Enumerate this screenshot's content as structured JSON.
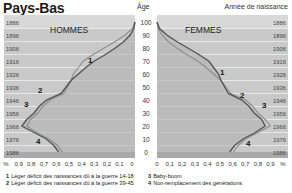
{
  "title": "Pays-Bas",
  "age_axis_label": "Âge",
  "birth_year_label": "Année de naissance",
  "colors": {
    "panel_bg": "#c9c9c9",
    "panel_band_light": "#d8d8d8",
    "grid": "#f0f0f0",
    "curve_dark": "#555555",
    "curve_light": "#8f8f8f",
    "fill": "#b3b3b3"
  },
  "chart_data": {
    "type": "population-pyramid",
    "title": "Pays-Bas",
    "panels": [
      {
        "name": "HOMMES",
        "side": "left"
      },
      {
        "name": "FEMMES",
        "side": "right"
      }
    ],
    "x_axis": {
      "label": "%",
      "left_ticks": [
        "%",
        "0,9",
        "0,8",
        "0,7",
        "0,6",
        "0,5",
        "0,4",
        "0,3",
        "0,2",
        "0,1",
        "0"
      ],
      "right_ticks": [
        "0",
        "0,1",
        "0,2",
        "0,3",
        "0,4",
        "0,5",
        "0,6",
        "0,7",
        "0,8",
        "0,9",
        "%"
      ],
      "range": [
        0,
        1.0
      ]
    },
    "y_axis": {
      "label": "Âge",
      "ticks": [
        0,
        10,
        20,
        30,
        40,
        50,
        60,
        70,
        80,
        90,
        100
      ],
      "range": [
        0,
        100
      ]
    },
    "birth_years": [
      "1886",
      "1896",
      "1906",
      "1916",
      "1926",
      "1936",
      "1946",
      "1956",
      "1966",
      "1976",
      "1986"
    ],
    "series": [
      {
        "name": "Hommes",
        "ages": [
          0,
          5,
          10,
          15,
          20,
          25,
          30,
          35,
          40,
          45,
          50,
          55,
          60,
          65,
          70,
          75,
          80,
          85,
          90,
          95,
          100
        ],
        "values": [
          0.62,
          0.66,
          0.72,
          0.82,
          0.92,
          0.88,
          0.82,
          0.78,
          0.72,
          0.6,
          0.56,
          0.52,
          0.46,
          0.4,
          0.33,
          0.24,
          0.16,
          0.09,
          0.04,
          0.01,
          0.0
        ]
      },
      {
        "name": "Femmes",
        "ages": [
          0,
          5,
          10,
          15,
          20,
          25,
          30,
          35,
          40,
          45,
          50,
          55,
          60,
          65,
          70,
          75,
          80,
          85,
          90,
          95,
          100
        ],
        "values": [
          0.59,
          0.63,
          0.7,
          0.8,
          0.88,
          0.85,
          0.79,
          0.75,
          0.69,
          0.58,
          0.55,
          0.52,
          0.5,
          0.46,
          0.42,
          0.34,
          0.25,
          0.16,
          0.08,
          0.02,
          0.0
        ]
      }
    ],
    "annotations": [
      {
        "id": "1",
        "age": 70,
        "text": "Léger déficit des naissances dû à la guerre 14-18"
      },
      {
        "id": "2",
        "age": 45,
        "text": "Léger déficit des naissances dû à la guerre 39-45"
      },
      {
        "id": "3",
        "age": 38,
        "text": "Baby-boom"
      },
      {
        "id": "4",
        "age": 12,
        "text": "Non-remplacement des générations"
      }
    ]
  },
  "legend": [
    {
      "num": "1",
      "text": "Léger déficit des naissances dû à la guerre 14-18"
    },
    {
      "num": "2",
      "text": "Léger déficit des naissances dû à la guerre 39-45"
    },
    {
      "num": "3",
      "text": "Baby-boom"
    },
    {
      "num": "4",
      "text": "Non-remplacement des générations"
    }
  ]
}
